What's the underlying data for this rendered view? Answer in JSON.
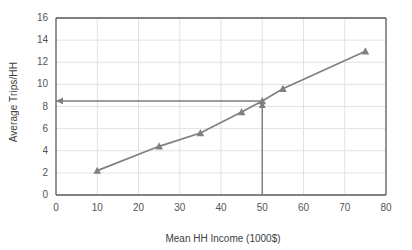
{
  "chart_data": {
    "type": "line",
    "title": "",
    "xlabel": "Mean HH Income (1000$)",
    "ylabel": "Average Trips/HH",
    "xlim": [
      0,
      80
    ],
    "ylim": [
      0,
      16
    ],
    "xticks": [
      "0",
      "10",
      "20",
      "30",
      "40",
      "50",
      "60",
      "70",
      "80"
    ],
    "yticks": [
      "0",
      "2",
      "4",
      "6",
      "8",
      "10",
      "12",
      "14",
      "16"
    ],
    "xtick_values": [
      0,
      10,
      20,
      30,
      40,
      50,
      60,
      70,
      80
    ],
    "ytick_values": [
      0,
      2,
      4,
      6,
      8,
      10,
      12,
      14,
      16
    ],
    "grid": true,
    "legend": "none",
    "series": [
      {
        "name": "Average Trips/HH",
        "marker": "triangle",
        "color": "#808080",
        "x": [
          10,
          25,
          35,
          45,
          50,
          55,
          75
        ],
        "y": [
          2.2,
          4.4,
          5.6,
          7.5,
          8.5,
          9.6,
          13.0
        ]
      }
    ],
    "annotations": [
      {
        "name": "vertical-reference-line",
        "type": "arrow",
        "from_x": 50,
        "from_y": 0,
        "to_x": 50,
        "to_y": 8.5,
        "color": "#808080"
      },
      {
        "name": "horizontal-reference-line",
        "type": "arrow",
        "from_x": 50,
        "from_y": 8.5,
        "to_x": 0,
        "to_y": 8.5,
        "color": "#808080"
      }
    ]
  }
}
